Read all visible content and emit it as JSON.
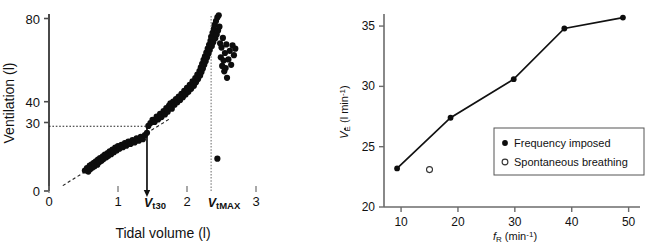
{
  "figure": {
    "panels": [
      "left-scatter-panel",
      "right-line-panel"
    ]
  },
  "chart_data": [
    {
      "id": "ventilation-vs-tidal-volume",
      "type": "scatter",
      "title": "",
      "xlabel": "Tidal volume (l)",
      "ylabel": "Ventilation (l)",
      "xlim": [
        0,
        3
      ],
      "ylim": [
        0,
        85
      ],
      "xticks": [
        0,
        1,
        2,
        3
      ],
      "xticklabels": [
        "0",
        "1",
        "2",
        "3"
      ],
      "yticks": [
        0,
        30,
        40,
        80
      ],
      "yticklabels": [
        "0",
        "30",
        "40",
        "80"
      ],
      "grid": false,
      "legend": "none",
      "annotations": [
        {
          "name": "vt30-marker",
          "label": "V",
          "sub": "t",
          "suffix": "30",
          "x": 1.42,
          "kind": "solid-vertical-with-arrow",
          "y_top": 30
        },
        {
          "name": "vtmax-marker",
          "label": "V",
          "sub": "t",
          "suffix": "MAX",
          "x": 2.35,
          "kind": "dotted-vertical",
          "y_top": 82
        },
        {
          "name": "ve30-guide",
          "kind": "horizontal-dotted",
          "y": 30,
          "x_from": 0,
          "x_to": 1.42
        }
      ],
      "fit_line": {
        "name": "linear-fit",
        "style": "dashed",
        "x_from": 0.2,
        "x_to": 1.75,
        "y_from": 2.5,
        "y_to": 33.5
      },
      "points": [
        [
          0.52,
          9.5
        ],
        [
          0.55,
          10.6
        ],
        [
          0.57,
          9.0
        ],
        [
          0.59,
          11.8
        ],
        [
          0.6,
          10.2
        ],
        [
          0.62,
          12.4
        ],
        [
          0.63,
          10.9
        ],
        [
          0.65,
          13.1
        ],
        [
          0.66,
          11.5
        ],
        [
          0.68,
          13.8
        ],
        [
          0.7,
          12.2
        ],
        [
          0.71,
          14.6
        ],
        [
          0.73,
          13.4
        ],
        [
          0.74,
          15.2
        ],
        [
          0.76,
          14.0
        ],
        [
          0.78,
          16.1
        ],
        [
          0.79,
          14.8
        ],
        [
          0.81,
          16.9
        ],
        [
          0.83,
          15.6
        ],
        [
          0.85,
          17.6
        ],
        [
          0.86,
          16.3
        ],
        [
          0.88,
          18.4
        ],
        [
          0.9,
          17.1
        ],
        [
          0.92,
          19.2
        ],
        [
          0.94,
          18.0
        ],
        [
          0.96,
          20.1
        ],
        [
          0.98,
          18.8
        ],
        [
          1.0,
          20.8
        ],
        [
          1.02,
          19.6
        ],
        [
          1.05,
          21.4
        ],
        [
          1.07,
          20.3
        ],
        [
          1.1,
          22.2
        ],
        [
          1.12,
          21.0
        ],
        [
          1.15,
          22.9
        ],
        [
          1.18,
          21.8
        ],
        [
          1.21,
          23.6
        ],
        [
          1.24,
          22.5
        ],
        [
          1.27,
          24.4
        ],
        [
          1.3,
          23.3
        ],
        [
          1.33,
          25.1
        ],
        [
          1.36,
          24.0
        ],
        [
          1.39,
          25.9
        ],
        [
          1.42,
          27.0
        ],
        [
          1.44,
          30.2
        ],
        [
          1.47,
          31.5
        ],
        [
          1.5,
          33.0
        ],
        [
          1.53,
          32.0
        ],
        [
          1.56,
          34.5
        ],
        [
          1.58,
          33.2
        ],
        [
          1.61,
          35.8
        ],
        [
          1.63,
          34.3
        ],
        [
          1.66,
          37.0
        ],
        [
          1.68,
          35.5
        ],
        [
          1.7,
          38.4
        ],
        [
          1.72,
          36.8
        ],
        [
          1.74,
          39.6
        ],
        [
          1.76,
          40.6
        ],
        [
          1.78,
          38.2
        ],
        [
          1.8,
          41.5
        ],
        [
          1.82,
          40.0
        ],
        [
          1.84,
          42.6
        ],
        [
          1.86,
          41.2
        ],
        [
          1.88,
          43.8
        ],
        [
          1.9,
          42.2
        ],
        [
          1.92,
          45.0
        ],
        [
          1.94,
          43.5
        ],
        [
          1.96,
          46.4
        ],
        [
          1.98,
          44.8
        ],
        [
          2.0,
          47.8
        ],
        [
          2.02,
          46.0
        ],
        [
          2.04,
          49.2
        ],
        [
          2.06,
          47.4
        ],
        [
          2.08,
          50.8
        ],
        [
          2.1,
          48.8
        ],
        [
          2.12,
          52.4
        ],
        [
          2.13,
          50.4
        ],
        [
          2.15,
          54.0
        ],
        [
          2.16,
          52.0
        ],
        [
          2.18,
          55.6
        ],
        [
          2.19,
          53.6
        ],
        [
          2.2,
          57.3
        ],
        [
          2.21,
          55.2
        ],
        [
          2.22,
          59.0
        ],
        [
          2.23,
          56.8
        ],
        [
          2.24,
          60.8
        ],
        [
          2.25,
          58.5
        ],
        [
          2.26,
          62.5
        ],
        [
          2.27,
          60.2
        ],
        [
          2.28,
          64.2
        ],
        [
          2.29,
          61.9
        ],
        [
          2.3,
          66.0
        ],
        [
          2.31,
          63.6
        ],
        [
          2.32,
          67.8
        ],
        [
          2.33,
          65.4
        ],
        [
          2.34,
          69.6
        ],
        [
          2.35,
          71.5
        ],
        [
          2.36,
          67.2
        ],
        [
          2.37,
          73.4
        ],
        [
          2.38,
          69.0
        ],
        [
          2.39,
          75.2
        ],
        [
          2.4,
          77.0
        ],
        [
          2.41,
          70.8
        ],
        [
          2.42,
          78.8
        ],
        [
          2.43,
          72.6
        ],
        [
          2.44,
          80.5
        ],
        [
          2.45,
          74.4
        ],
        [
          2.46,
          81.5
        ],
        [
          2.47,
          76.2
        ],
        [
          2.48,
          68.5
        ],
        [
          2.49,
          62.0
        ],
        [
          2.5,
          66.5
        ],
        [
          2.51,
          58.0
        ],
        [
          2.52,
          71.0
        ],
        [
          2.53,
          60.5
        ],
        [
          2.54,
          55.5
        ],
        [
          2.55,
          64.0
        ],
        [
          2.56,
          57.0
        ],
        [
          2.57,
          68.0
        ],
        [
          2.58,
          52.5
        ],
        [
          2.6,
          61.0
        ],
        [
          2.62,
          65.0
        ],
        [
          2.64,
          58.5
        ],
        [
          2.66,
          67.5
        ],
        [
          2.68,
          63.0
        ],
        [
          2.7,
          66.0
        ],
        [
          2.44,
          15.0
        ]
      ]
    },
    {
      "id": "minute-ventilation-vs-respiratory-frequency",
      "type": "line",
      "title": "",
      "xlabel": "fR (min-1)",
      "xlabel_parts": {
        "italic": "f",
        "sub": "R",
        "rest": " (min",
        "sup": "-1",
        "tail": ")"
      },
      "ylabel": "VE (l min-1)",
      "ylabel_parts": {
        "italic": "V",
        "sub": "E",
        "rest": " (l min",
        "sup": "-1",
        "tail": ")"
      },
      "xlim": [
        7,
        52
      ],
      "ylim": [
        20,
        36
      ],
      "xticks": [
        10,
        20,
        30,
        40,
        50
      ],
      "xticklabels": [
        "10",
        "20",
        "30",
        "40",
        "50"
      ],
      "yticks": [
        20,
        25,
        30,
        35
      ],
      "yticklabels": [
        "20",
        "25",
        "30",
        "35"
      ],
      "grid": false,
      "legend_position": "inside-lower-right",
      "series": [
        {
          "name": "Frequency imposed",
          "marker": "filled-circle",
          "x": [
            9.3,
            18.7,
            29.8,
            38.7,
            49.0
          ],
          "values": [
            23.2,
            27.4,
            30.6,
            34.8,
            35.7
          ]
        },
        {
          "name": "Spontaneous breathing",
          "marker": "open-circle",
          "x": [
            15.0
          ],
          "values": [
            23.1
          ]
        }
      ],
      "legend_entries": [
        {
          "marker": "filled-circle",
          "label": "Frequency imposed"
        },
        {
          "marker": "open-circle",
          "label": "Spontaneous breathing"
        }
      ]
    }
  ]
}
